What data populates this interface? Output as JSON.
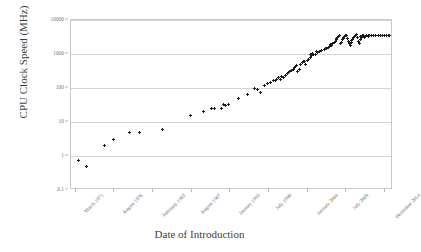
{
  "chart_data": {
    "type": "scatter",
    "title": "",
    "xlabel": "Date of Introduction",
    "ylabel": "CPU Clock Speed (MHz)",
    "yscale": "log",
    "ylim": [
      0.1,
      10000
    ],
    "yticks": [
      "0.1",
      "1",
      "10",
      "100",
      "1000",
      "10000"
    ],
    "ytick_values": [
      0.1,
      1,
      10,
      100,
      1000,
      10000
    ],
    "grid": true,
    "legend": "none",
    "marker": "plus",
    "marker_color": "#1d1d1d",
    "xticks": [
      "March 1971",
      "August 1976",
      "February 1982",
      "August 1987",
      "January 1993",
      "July 1998",
      "January 2004",
      "July 2009",
      "December 2014"
    ],
    "xtick_fractions": [
      0.015,
      0.135,
      0.255,
      0.375,
      0.495,
      0.615,
      0.735,
      0.855,
      0.975
    ],
    "points": [
      {
        "x": 0.022,
        "y": 0.74
      },
      {
        "x": 0.047,
        "y": 0.5
      },
      {
        "x": 0.105,
        "y": 2.0
      },
      {
        "x": 0.133,
        "y": 3.0
      },
      {
        "x": 0.183,
        "y": 5.0
      },
      {
        "x": 0.213,
        "y": 5.0
      },
      {
        "x": 0.283,
        "y": 6.0
      },
      {
        "x": 0.372,
        "y": 16.0
      },
      {
        "x": 0.412,
        "y": 20.0
      },
      {
        "x": 0.437,
        "y": 25.0
      },
      {
        "x": 0.447,
        "y": 25.0
      },
      {
        "x": 0.468,
        "y": 25.0
      },
      {
        "x": 0.474,
        "y": 33.0
      },
      {
        "x": 0.479,
        "y": 30.0
      },
      {
        "x": 0.489,
        "y": 33.0
      },
      {
        "x": 0.519,
        "y": 50.0
      },
      {
        "x": 0.549,
        "y": 66.0
      },
      {
        "x": 0.569,
        "y": 100.0
      },
      {
        "x": 0.579,
        "y": 90.0
      },
      {
        "x": 0.589,
        "y": 75.0
      },
      {
        "x": 0.6,
        "y": 120.0
      },
      {
        "x": 0.61,
        "y": 133.0
      },
      {
        "x": 0.62,
        "y": 150.0
      },
      {
        "x": 0.629,
        "y": 166.0
      },
      {
        "x": 0.638,
        "y": 180.0
      },
      {
        "x": 0.645,
        "y": 200.0
      },
      {
        "x": 0.651,
        "y": 180.0
      },
      {
        "x": 0.659,
        "y": 200.0
      },
      {
        "x": 0.666,
        "y": 233.0
      },
      {
        "x": 0.672,
        "y": 266.0
      },
      {
        "x": 0.678,
        "y": 300.0
      },
      {
        "x": 0.684,
        "y": 333.0
      },
      {
        "x": 0.69,
        "y": 350.0
      },
      {
        "x": 0.695,
        "y": 400.0
      },
      {
        "x": 0.7,
        "y": 450.0
      },
      {
        "x": 0.704,
        "y": 300.0
      },
      {
        "x": 0.709,
        "y": 350.0
      },
      {
        "x": 0.714,
        "y": 500.0
      },
      {
        "x": 0.719,
        "y": 550.0
      },
      {
        "x": 0.723,
        "y": 600.0
      },
      {
        "x": 0.728,
        "y": 500.0
      },
      {
        "x": 0.733,
        "y": 650.0
      },
      {
        "x": 0.738,
        "y": 700.0
      },
      {
        "x": 0.743,
        "y": 800.0
      },
      {
        "x": 0.748,
        "y": 900.0
      },
      {
        "x": 0.753,
        "y": 1000.0
      },
      {
        "x": 0.758,
        "y": 1000.0
      },
      {
        "x": 0.765,
        "y": 1100.0
      },
      {
        "x": 0.772,
        "y": 1200.0
      },
      {
        "x": 0.779,
        "y": 1300.0
      },
      {
        "x": 0.786,
        "y": 1400.0
      },
      {
        "x": 0.793,
        "y": 1500.0
      },
      {
        "x": 0.799,
        "y": 1600.0
      },
      {
        "x": 0.804,
        "y": 1700.0
      },
      {
        "x": 0.809,
        "y": 1800.0
      },
      {
        "x": 0.813,
        "y": 2000.0
      },
      {
        "x": 0.817,
        "y": 2200.0
      },
      {
        "x": 0.82,
        "y": 2400.0
      },
      {
        "x": 0.823,
        "y": 2600.0
      },
      {
        "x": 0.826,
        "y": 2800.0
      },
      {
        "x": 0.829,
        "y": 3000.0
      },
      {
        "x": 0.832,
        "y": 3200.0
      },
      {
        "x": 0.835,
        "y": 3400.0
      },
      {
        "x": 0.838,
        "y": 2000.0
      },
      {
        "x": 0.841,
        "y": 2200.0
      },
      {
        "x": 0.844,
        "y": 2600.0
      },
      {
        "x": 0.847,
        "y": 3000.0
      },
      {
        "x": 0.85,
        "y": 3200.0
      },
      {
        "x": 0.853,
        "y": 3400.0
      },
      {
        "x": 0.856,
        "y": 3600.0
      },
      {
        "x": 0.859,
        "y": 2800.0
      },
      {
        "x": 0.862,
        "y": 2400.0
      },
      {
        "x": 0.865,
        "y": 2000.0
      },
      {
        "x": 0.868,
        "y": 1800.0
      },
      {
        "x": 0.871,
        "y": 2200.0
      },
      {
        "x": 0.874,
        "y": 2600.0
      },
      {
        "x": 0.877,
        "y": 3000.0
      },
      {
        "x": 0.88,
        "y": 3300.0
      },
      {
        "x": 0.883,
        "y": 3600.0
      },
      {
        "x": 0.886,
        "y": 3800.0
      },
      {
        "x": 0.889,
        "y": 3000.0
      },
      {
        "x": 0.892,
        "y": 2400.0
      },
      {
        "x": 0.895,
        "y": 2000.0
      },
      {
        "x": 0.898,
        "y": 2600.0
      },
      {
        "x": 0.901,
        "y": 3000.0
      },
      {
        "x": 0.904,
        "y": 3400.0
      },
      {
        "x": 0.907,
        "y": 3600.0
      },
      {
        "x": 0.911,
        "y": 3000.0
      },
      {
        "x": 0.915,
        "y": 3300.0
      },
      {
        "x": 0.919,
        "y": 3500.0
      },
      {
        "x": 0.923,
        "y": 3600.0
      },
      {
        "x": 0.928,
        "y": 3400.0
      },
      {
        "x": 0.933,
        "y": 3500.0
      },
      {
        "x": 0.94,
        "y": 3500.0
      },
      {
        "x": 0.947,
        "y": 3600.0
      },
      {
        "x": 0.954,
        "y": 3500.0
      },
      {
        "x": 0.968,
        "y": 3600.0
      },
      {
        "x": 0.975,
        "y": 3400.0
      },
      {
        "x": 0.98,
        "y": 3600.0
      },
      {
        "x": 0.985,
        "y": 3500.0
      },
      {
        "x": 0.99,
        "y": 3600.0
      },
      {
        "x": 0.744,
        "y": 950.0
      },
      {
        "x": 0.762,
        "y": 1150.0
      },
      {
        "x": 0.79,
        "y": 1450.0
      },
      {
        "x": 0.806,
        "y": 1900.0
      },
      {
        "x": 0.828,
        "y": 3100.0
      },
      {
        "x": 0.845,
        "y": 2900.0
      },
      {
        "x": 0.87,
        "y": 2500.0
      },
      {
        "x": 0.884,
        "y": 3500.0
      },
      {
        "x": 0.9,
        "y": 3200.0
      },
      {
        "x": 0.925,
        "y": 3300.0
      },
      {
        "x": 0.96,
        "y": 3500.0
      },
      {
        "x": 0.636,
        "y": 166.0
      },
      {
        "x": 0.655,
        "y": 220.0
      },
      {
        "x": 0.676,
        "y": 280.0
      },
      {
        "x": 0.698,
        "y": 420.0
      },
      {
        "x": 0.726,
        "y": 620.0
      },
      {
        "x": 0.75,
        "y": 1050.0
      }
    ]
  }
}
